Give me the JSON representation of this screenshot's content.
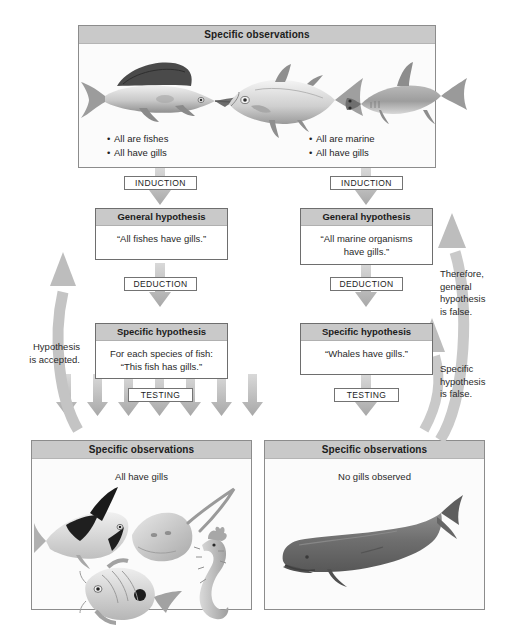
{
  "diagram": {
    "colors": {
      "header_gray": "#c9c9c9",
      "arrow_gray": "#b3b3b3",
      "panel_border": "#8c8c8c",
      "text": "#231f20"
    }
  },
  "top_panel": {
    "header": "Specific observations",
    "left_bullets": [
      "All are fishes",
      "All have gills"
    ],
    "right_bullets": [
      "All are marine",
      "All have gills"
    ],
    "animals": [
      "sailfish",
      "tuna",
      "hammerhead-shark"
    ]
  },
  "left_column": {
    "induction_label": "INDUCTION",
    "general_hypothesis": {
      "header": "General hypothesis",
      "text": "“All fishes have gills.”"
    },
    "deduction_label": "DEDUCTION",
    "specific_hypothesis": {
      "header": "Specific hypothesis",
      "line1": "For each species of fish:",
      "line2": "“This fish has gills.”"
    },
    "testing_label": "TESTING",
    "observations": {
      "header": "Specific observations",
      "caption": "All have gills",
      "animals": [
        "angelfish",
        "stingray",
        "seahorse",
        "butterflyfish"
      ]
    },
    "feedback_note": [
      "Hypothesis",
      "is accepted."
    ]
  },
  "right_column": {
    "induction_label": "INDUCTION",
    "general_hypothesis": {
      "header": "General hypothesis",
      "line1": "“All marine organisms",
      "line2": "have gills.”"
    },
    "deduction_label": "DEDUCTION",
    "specific_hypothesis": {
      "header": "Specific hypothesis",
      "text": "“Whales have gills.”"
    },
    "testing_label": "TESTING",
    "observations": {
      "header": "Specific observations",
      "caption": "No gills observed",
      "animals": [
        "sperm-whale"
      ]
    },
    "note_upper": [
      "Therefore,",
      "general",
      "hypothesis",
      "is false."
    ],
    "note_lower": [
      "Specific",
      "hypothesis",
      "is false."
    ]
  }
}
